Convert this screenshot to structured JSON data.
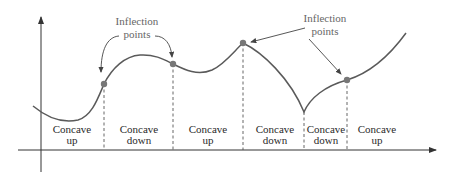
{
  "diagram": {
    "annotations": [
      {
        "line1": "Inflection",
        "line2": "points",
        "x": 137,
        "y1": 25,
        "y2": 38
      },
      {
        "line1": "Inflection",
        "line2": "points",
        "x": 325,
        "y1": 22,
        "y2": 34
      }
    ],
    "regions": [
      {
        "line1": "Concave",
        "line2": "up",
        "x": 72
      },
      {
        "line1": "Concave",
        "line2": "down",
        "x": 139
      },
      {
        "line1": "Concave",
        "line2": "up",
        "x": 208
      },
      {
        "line1": "Concave",
        "line2": "down",
        "x": 275
      },
      {
        "line1": "Concave",
        "line2": "down",
        "x": 326
      },
      {
        "line1": "Concave",
        "line2": "up",
        "x": 377
      }
    ],
    "inflection_points": [
      {
        "x": 104,
        "y": 84
      },
      {
        "x": 173,
        "y": 64
      },
      {
        "x": 243,
        "y": 43
      },
      {
        "x": 347,
        "y": 80
      }
    ],
    "cusp": {
      "x": 304,
      "y": 112
    },
    "colors": {
      "curve": "#5a5a5a",
      "point": "#777777",
      "axis": "#333333",
      "annotation": "#666666"
    }
  }
}
